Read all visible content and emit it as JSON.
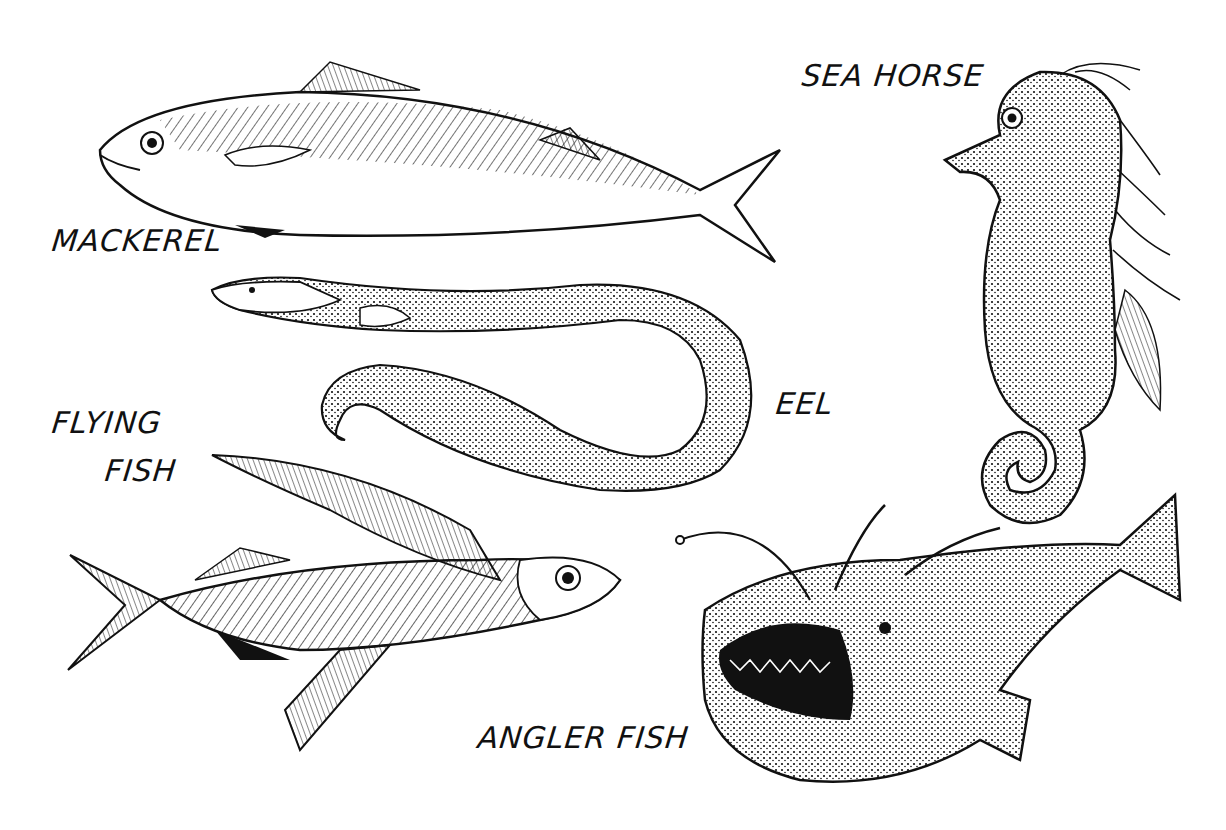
{
  "labels": {
    "mackerel": "MACKEREL",
    "sea_horse": "SEA HORSE",
    "eel": "EEL",
    "flying_fish_line1": "FLYING",
    "flying_fish_line2": "FISH",
    "angler_fish": "ANGLER FISH"
  },
  "colors": {
    "ink": "#111111",
    "paper": "#ffffff"
  }
}
